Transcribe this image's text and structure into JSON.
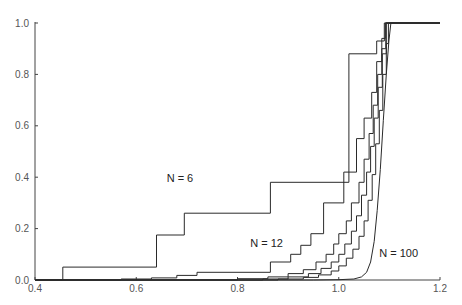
{
  "chart_data": {
    "type": "line",
    "title": "",
    "xlabel": "",
    "ylabel": "",
    "xlim": [
      0.4,
      1.2
    ],
    "ylim": [
      0.0,
      1.0
    ],
    "grid": false,
    "legend": "none (inline curve labels)",
    "x_ticks": [
      "0.4",
      "0.6",
      "0.8",
      "1.0",
      "1.2"
    ],
    "y_ticks": [
      "0.0",
      "0.2",
      "0.4",
      "0.6",
      "0.8",
      "1.0"
    ],
    "annotations": [
      {
        "text": "N = 6",
        "x": 0.66,
        "y": 0.38
      },
      {
        "text": "N = 12",
        "x": 0.825,
        "y": 0.13
      },
      {
        "text": "N = 100",
        "x": 1.08,
        "y": 0.09
      }
    ],
    "series": [
      {
        "name": "N = 6",
        "step": true,
        "points": [
          [
            0.4,
            0.0
          ],
          [
            0.455,
            0.0
          ],
          [
            0.455,
            0.05
          ],
          [
            0.64,
            0.05
          ],
          [
            0.64,
            0.175
          ],
          [
            0.695,
            0.175
          ],
          [
            0.695,
            0.26
          ],
          [
            0.865,
            0.26
          ],
          [
            0.865,
            0.38
          ],
          [
            1.02,
            0.38
          ],
          [
            1.02,
            0.88
          ],
          [
            1.075,
            0.88
          ],
          [
            1.075,
            0.93
          ],
          [
            1.09,
            0.93
          ],
          [
            1.09,
            1.0
          ],
          [
            1.2,
            1.0
          ]
        ]
      },
      {
        "name": "N = 12",
        "step": true,
        "points": [
          [
            0.4,
            0.0
          ],
          [
            0.57,
            0.0
          ],
          [
            0.57,
            0.004
          ],
          [
            0.63,
            0.004
          ],
          [
            0.63,
            0.008
          ],
          [
            0.68,
            0.008
          ],
          [
            0.68,
            0.018
          ],
          [
            0.72,
            0.018
          ],
          [
            0.72,
            0.03
          ],
          [
            0.865,
            0.03
          ],
          [
            0.865,
            0.07
          ],
          [
            0.905,
            0.07
          ],
          [
            0.905,
            0.1
          ],
          [
            0.925,
            0.1
          ],
          [
            0.925,
            0.135
          ],
          [
            0.945,
            0.135
          ],
          [
            0.945,
            0.18
          ],
          [
            0.97,
            0.18
          ],
          [
            0.97,
            0.3
          ],
          [
            1.01,
            0.3
          ],
          [
            1.01,
            0.42
          ],
          [
            1.035,
            0.42
          ],
          [
            1.035,
            0.55
          ],
          [
            1.05,
            0.55
          ],
          [
            1.05,
            0.63
          ],
          [
            1.065,
            0.63
          ],
          [
            1.065,
            0.73
          ],
          [
            1.075,
            0.73
          ],
          [
            1.075,
            0.85
          ],
          [
            1.085,
            0.85
          ],
          [
            1.085,
            0.94
          ],
          [
            1.092,
            0.94
          ],
          [
            1.092,
            1.0
          ],
          [
            1.2,
            1.0
          ]
        ]
      },
      {
        "name": "N ≈ 20",
        "step": true,
        "points": [
          [
            0.4,
            0.0
          ],
          [
            0.8,
            0.0
          ],
          [
            0.8,
            0.005
          ],
          [
            0.86,
            0.005
          ],
          [
            0.86,
            0.012
          ],
          [
            0.9,
            0.012
          ],
          [
            0.9,
            0.025
          ],
          [
            0.93,
            0.025
          ],
          [
            0.93,
            0.04
          ],
          [
            0.955,
            0.04
          ],
          [
            0.955,
            0.07
          ],
          [
            0.975,
            0.07
          ],
          [
            0.975,
            0.1
          ],
          [
            0.99,
            0.1
          ],
          [
            0.99,
            0.14
          ],
          [
            1.0,
            0.14
          ],
          [
            1.0,
            0.18
          ],
          [
            1.015,
            0.18
          ],
          [
            1.015,
            0.23
          ],
          [
            1.025,
            0.23
          ],
          [
            1.025,
            0.3
          ],
          [
            1.04,
            0.3
          ],
          [
            1.04,
            0.38
          ],
          [
            1.05,
            0.38
          ],
          [
            1.05,
            0.47
          ],
          [
            1.06,
            0.47
          ],
          [
            1.06,
            0.57
          ],
          [
            1.068,
            0.57
          ],
          [
            1.068,
            0.68
          ],
          [
            1.077,
            0.68
          ],
          [
            1.077,
            0.8
          ],
          [
            1.085,
            0.8
          ],
          [
            1.085,
            0.9
          ],
          [
            1.093,
            0.9
          ],
          [
            1.093,
            1.0
          ],
          [
            1.2,
            1.0
          ]
        ]
      },
      {
        "name": "N ≈ 30",
        "step": true,
        "points": [
          [
            0.4,
            0.0
          ],
          [
            0.85,
            0.0
          ],
          [
            0.85,
            0.004
          ],
          [
            0.9,
            0.004
          ],
          [
            0.9,
            0.012
          ],
          [
            0.94,
            0.012
          ],
          [
            0.94,
            0.025
          ],
          [
            0.965,
            0.025
          ],
          [
            0.965,
            0.045
          ],
          [
            0.985,
            0.045
          ],
          [
            0.985,
            0.07
          ],
          [
            1.0,
            0.07
          ],
          [
            1.0,
            0.1
          ],
          [
            1.012,
            0.1
          ],
          [
            1.012,
            0.14
          ],
          [
            1.025,
            0.14
          ],
          [
            1.025,
            0.19
          ],
          [
            1.035,
            0.19
          ],
          [
            1.035,
            0.25
          ],
          [
            1.045,
            0.25
          ],
          [
            1.045,
            0.33
          ],
          [
            1.055,
            0.33
          ],
          [
            1.055,
            0.42
          ],
          [
            1.063,
            0.42
          ],
          [
            1.063,
            0.52
          ],
          [
            1.07,
            0.52
          ],
          [
            1.07,
            0.63
          ],
          [
            1.078,
            0.63
          ],
          [
            1.078,
            0.75
          ],
          [
            1.086,
            0.75
          ],
          [
            1.086,
            0.88
          ],
          [
            1.094,
            0.88
          ],
          [
            1.094,
            1.0
          ],
          [
            1.2,
            1.0
          ]
        ]
      },
      {
        "name": "N ≈ 40",
        "step": true,
        "points": [
          [
            0.4,
            0.0
          ],
          [
            0.88,
            0.0
          ],
          [
            0.88,
            0.004
          ],
          [
            0.93,
            0.004
          ],
          [
            0.93,
            0.01
          ],
          [
            0.96,
            0.01
          ],
          [
            0.96,
            0.02
          ],
          [
            0.985,
            0.02
          ],
          [
            0.985,
            0.035
          ],
          [
            1.0,
            0.035
          ],
          [
            1.0,
            0.055
          ],
          [
            1.015,
            0.055
          ],
          [
            1.015,
            0.085
          ],
          [
            1.028,
            0.085
          ],
          [
            1.028,
            0.12
          ],
          [
            1.04,
            0.12
          ],
          [
            1.04,
            0.17
          ],
          [
            1.05,
            0.17
          ],
          [
            1.05,
            0.23
          ],
          [
            1.058,
            0.23
          ],
          [
            1.058,
            0.31
          ],
          [
            1.066,
            0.31
          ],
          [
            1.066,
            0.41
          ],
          [
            1.073,
            0.41
          ],
          [
            1.073,
            0.53
          ],
          [
            1.08,
            0.53
          ],
          [
            1.08,
            0.66
          ],
          [
            1.087,
            0.66
          ],
          [
            1.087,
            0.8
          ],
          [
            1.094,
            0.8
          ],
          [
            1.094,
            0.92
          ],
          [
            1.098,
            0.92
          ],
          [
            1.098,
            1.0
          ],
          [
            1.2,
            1.0
          ]
        ]
      },
      {
        "name": "N = 100",
        "step": false,
        "points": [
          [
            0.4,
            0.0
          ],
          [
            0.95,
            0.0
          ],
          [
            1.0,
            0.001
          ],
          [
            1.03,
            0.004
          ],
          [
            1.045,
            0.012
          ],
          [
            1.055,
            0.03
          ],
          [
            1.063,
            0.07
          ],
          [
            1.07,
            0.15
          ],
          [
            1.076,
            0.27
          ],
          [
            1.082,
            0.43
          ],
          [
            1.088,
            0.62
          ],
          [
            1.094,
            0.8
          ],
          [
            1.099,
            0.93
          ],
          [
            1.103,
            1.0
          ],
          [
            1.2,
            1.0
          ]
        ]
      }
    ]
  }
}
